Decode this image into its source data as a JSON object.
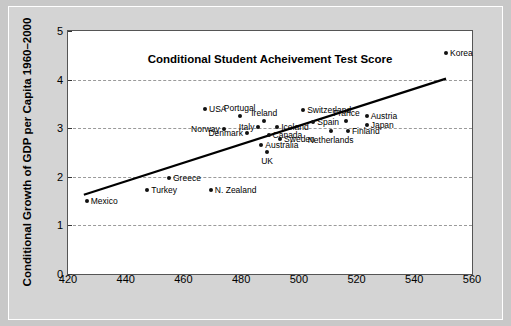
{
  "chart_data": {
    "type": "scatter",
    "title": "",
    "xlabel": "Conditional  Student Acheivement Test Score",
    "ylabel": "Conditional Growth of GDP per Capita 1960–2000",
    "xlim": [
      420,
      560
    ],
    "ylim": [
      0,
      5
    ],
    "xticks": [
      420,
      440,
      460,
      480,
      500,
      520,
      540,
      560
    ],
    "yticks": [
      0,
      1,
      2,
      3,
      4,
      5
    ],
    "grid": "horizontal-dashed",
    "legend": "none",
    "points": [
      {
        "label": "Mexico",
        "x": 426.5,
        "y": 1.51,
        "label_pos": "right"
      },
      {
        "label": "Turkey",
        "x": 447.5,
        "y": 1.72,
        "label_pos": "right"
      },
      {
        "label": "Greece",
        "x": 455.0,
        "y": 1.97,
        "label_pos": "right"
      },
      {
        "label": "N. Zealand",
        "x": 469.5,
        "y": 1.72,
        "label_pos": "right"
      },
      {
        "label": "USA",
        "x": 467.5,
        "y": 3.4,
        "label_pos": "right"
      },
      {
        "label": "Norway",
        "x": 474.0,
        "y": 2.99,
        "label_pos": "left"
      },
      {
        "label": "Portugal",
        "x": 479.5,
        "y": 3.25,
        "label_pos": "above"
      },
      {
        "label": "Denmark",
        "x": 482.0,
        "y": 2.91,
        "label_pos": "left"
      },
      {
        "label": "Italy",
        "x": 486.0,
        "y": 3.02,
        "label_pos": "left"
      },
      {
        "label": "Ireland",
        "x": 488.0,
        "y": 3.15,
        "label_pos": "above"
      },
      {
        "label": "Australia",
        "x": 487.0,
        "y": 2.65,
        "label_pos": "right"
      },
      {
        "label": "Canada",
        "x": 489.5,
        "y": 2.87,
        "label_pos": "right"
      },
      {
        "label": "UK",
        "x": 489.0,
        "y": 2.52,
        "label_pos": "below"
      },
      {
        "label": "Iceland",
        "x": 492.5,
        "y": 3.03,
        "label_pos": "right"
      },
      {
        "label": "Sweden",
        "x": 493.5,
        "y": 2.78,
        "label_pos": "right"
      },
      {
        "label": "Switzerland",
        "x": 501.5,
        "y": 3.38,
        "label_pos": "right"
      },
      {
        "label": "Spain",
        "x": 505.0,
        "y": 3.12,
        "label_pos": "right"
      },
      {
        "label": "Netherlands",
        "x": 511.0,
        "y": 2.94,
        "label_pos": "below"
      },
      {
        "label": "France",
        "x": 516.5,
        "y": 3.14,
        "label_pos": "above"
      },
      {
        "label": "Finland",
        "x": 517.0,
        "y": 2.95,
        "label_pos": "right"
      },
      {
        "label": "Austria",
        "x": 523.5,
        "y": 3.25,
        "label_pos": "right"
      },
      {
        "label": "Japan",
        "x": 523.5,
        "y": 3.07,
        "label_pos": "right"
      },
      {
        "label": "Korea",
        "x": 551.0,
        "y": 4.55,
        "label_pos": "right"
      }
    ],
    "trendline": {
      "type": "linear-fit",
      "x_start": 425.5,
      "y_start": 1.63,
      "x_end": 551.0,
      "y_end": 4.02
    },
    "colors": {
      "figure_background": "#d4d4d4",
      "plot_background": "#ffffff",
      "point": "#111111",
      "trendline": "#000000",
      "gridline": "#9a9a9a",
      "axis": "#555555"
    }
  }
}
